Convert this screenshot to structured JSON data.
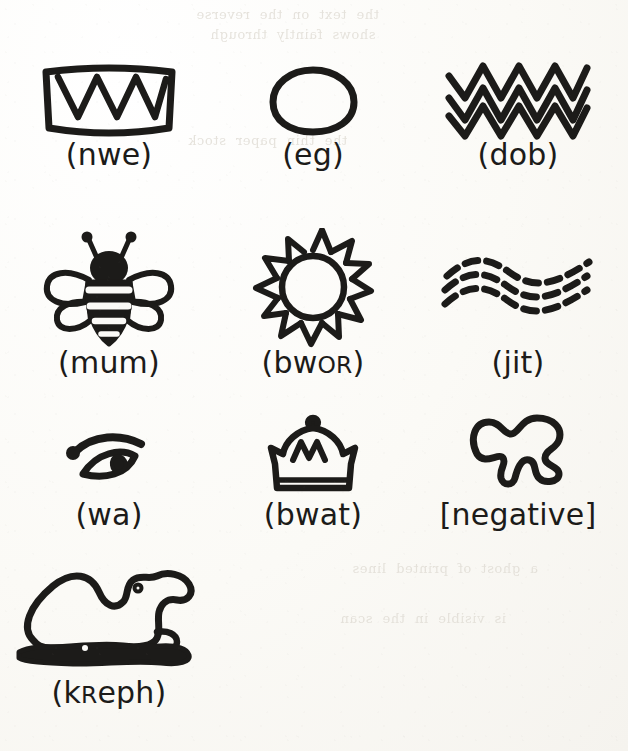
{
  "page": {
    "kind": "scanned-book-page",
    "ink_color": "#1c1b19",
    "paper_color": "#fbfaf7",
    "bleed_color": "#dedad2"
  },
  "bleed_through": {
    "line_1": "the  text  on  the  reverse",
    "line_2": "shows  faintly  through",
    "line_3": "the  thin  paper  stock",
    "line_4": "a  ghost  of  printed  lines",
    "line_5": "is  visible  in  the  scan"
  },
  "glyphs": [
    {
      "id": "nwe",
      "icon": "teeth-icon",
      "label": "(nwe)",
      "transcription": "nwe",
      "bracket": "round",
      "picture": "teeth / jaw with three pointed teeth",
      "row": 1,
      "column": 1
    },
    {
      "id": "eg",
      "icon": "egg-icon",
      "label": "(eg)",
      "transcription": "eg",
      "bracket": "round",
      "picture": "egg / oval outline",
      "row": 1,
      "column": 2
    },
    {
      "id": "dob",
      "icon": "zigzag-water-icon",
      "label": "(dob)",
      "transcription": "dob",
      "bracket": "round",
      "picture": "three stacked zigzag lines",
      "row": 1,
      "column": 3
    },
    {
      "id": "mum",
      "icon": "bee-icon",
      "label": "(mum)",
      "transcription": "mum",
      "bracket": "round",
      "picture": "bee seen from above with wings and striped abdomen",
      "row": 2,
      "column": 1
    },
    {
      "id": "bwor",
      "icon": "sun-icon",
      "label_prefix": "(bw",
      "label_smallcaps": "or",
      "label_suffix": ")",
      "label": "(bwoR)",
      "transcription": "bwoR",
      "bracket": "round",
      "picture": "sun with twelve triangular rays",
      "row": 2,
      "column": 2
    },
    {
      "id": "jit",
      "icon": "dashed-waves-icon",
      "label": "(jit)",
      "transcription": "jit",
      "bracket": "round",
      "picture": "three dashed wavy lines",
      "row": 2,
      "column": 3
    },
    {
      "id": "wa",
      "icon": "eye-icon",
      "label": "(wa)",
      "transcription": "wa",
      "bracket": "round",
      "picture": "eye in profile with brow",
      "row": 3,
      "column": 1
    },
    {
      "id": "bwat",
      "icon": "crown-icon",
      "label": "(bwat)",
      "transcription": "bwat",
      "bracket": "round",
      "picture": "crown with knob and zigzag band",
      "row": 3,
      "column": 2
    },
    {
      "id": "negative",
      "icon": "blob-outline-icon",
      "label": "[negative]",
      "transcription": "negative",
      "bracket": "square",
      "picture": "irregular closed blob outline",
      "row": 3,
      "column": 3
    },
    {
      "id": "kreph",
      "icon": "camel-icon",
      "label_prefix": "(k",
      "label_smallcaps": "r",
      "label_suffix": "eph)",
      "label": "(kReph)",
      "transcription": "kReph",
      "bracket": "round",
      "picture": "couchant camel on a filled ground line",
      "row": 4,
      "column": 1
    }
  ]
}
